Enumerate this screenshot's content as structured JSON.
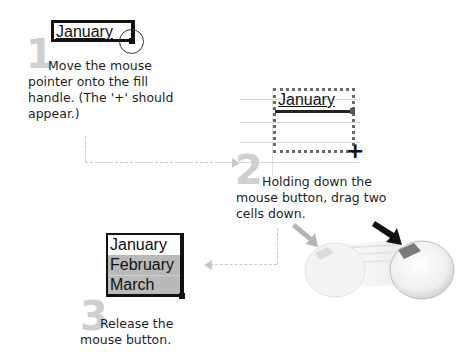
{
  "steps": [
    {
      "number": "1",
      "cell_value": "January",
      "text": "Move the mouse pointer onto the fill handle. (The '+' should appear.)"
    },
    {
      "number": "2",
      "cell_value": "January",
      "cursor_glyph": "+",
      "text": "Holding down the mouse button, drag two cells down."
    },
    {
      "number": "3",
      "cells": [
        "January",
        "February",
        "March"
      ],
      "text": "Release the mouse button."
    }
  ],
  "illustration": {
    "name": "mouse-button-press",
    "arrow_light_color": "#b5b5b5",
    "arrow_dark_color": "#111111",
    "button_color": "#7a7a7a"
  },
  "colors": {
    "step_number": "#cfcfcf",
    "connector": "#c8c8c8",
    "selection_fill": "#b9b9b9"
  }
}
